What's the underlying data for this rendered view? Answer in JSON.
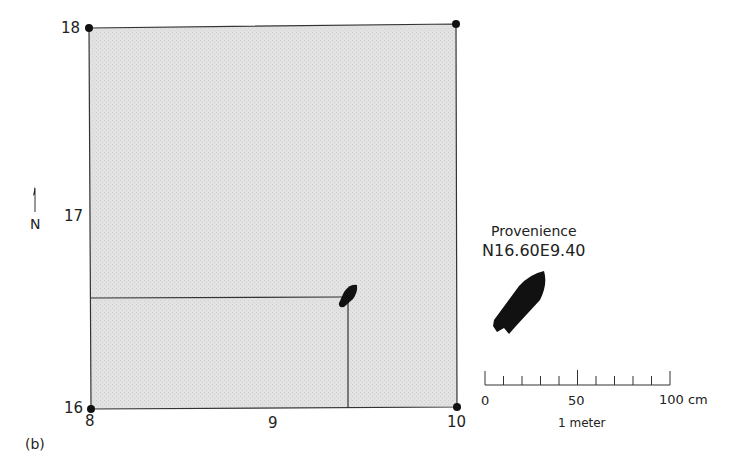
{
  "figure": {
    "panel_label": "(b)",
    "grid_unit": {
      "y_labels": {
        "top": "18",
        "middle": "17",
        "bottom": "16"
      },
      "x_labels": {
        "left": "8",
        "middle": "9",
        "right": "10"
      },
      "fill_color": "#e4e4e4",
      "border_color": "#333333"
    },
    "north_arrow": {
      "label": "N"
    },
    "artifact": {
      "provenience_title": "Provenience",
      "provenience_value": "N16.60E9.40",
      "color": "#111111"
    },
    "scale_bar": {
      "labels": {
        "start": "0",
        "mid": "50",
        "end": "100 cm"
      },
      "caption": "1 meter",
      "divisions": 10
    }
  }
}
